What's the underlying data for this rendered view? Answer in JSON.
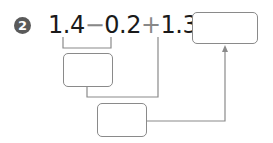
{
  "problem": {
    "number": "2",
    "expression": {
      "term1": "1.4",
      "op1": "−",
      "term2": "0.2",
      "op2": "+",
      "term3": "1.3",
      "equals": "="
    },
    "answer_box": "",
    "step1_box": "",
    "step2_box": ""
  },
  "colors": {
    "badge": "#5a5a5a",
    "text": "#1a1a1a",
    "lines": "#8a8a8a"
  }
}
